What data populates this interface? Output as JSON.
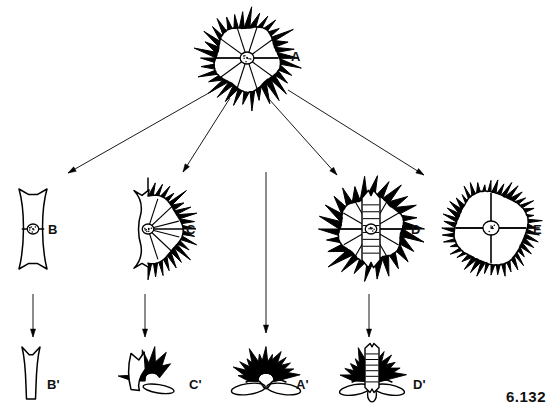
{
  "figure": {
    "plate_number": "6.132",
    "background_color": "#ffffff",
    "ink_color": "#000000",
    "width": 560,
    "height": 418
  },
  "specimens": [
    {
      "id": "A",
      "label": "A",
      "label_x": 291,
      "label_y": 50,
      "cx": 247,
      "cy": 58,
      "radius": 39,
      "type": "full-disc",
      "description": "complete radially spiny disc with central nucleus",
      "has_nucleus": true,
      "nucleus_r": 6,
      "rays": 10,
      "spines": 34,
      "spine_len": 12,
      "row": "top"
    },
    {
      "id": "B",
      "label": "B",
      "label_x": 48,
      "label_y": 223,
      "cx": 33,
      "cy": 229,
      "radius": 40,
      "half_width": 14,
      "type": "narrow-bar",
      "description": "narrow elongate bar with notched ends and central nucleus",
      "has_nucleus": true,
      "nucleus_r": 5,
      "rays": 0,
      "spines": 0,
      "spine_len": 0,
      "row": "middle"
    },
    {
      "id": "C",
      "label": "C",
      "label_x": 186,
      "label_y": 223,
      "cx": 148,
      "cy": 229,
      "radius": 40,
      "type": "half-disc",
      "description": "half disc, flat notched left margin, spiny fringe on right",
      "has_nucleus": true,
      "nucleus_r": 5,
      "rays": 6,
      "spines": 20,
      "spine_len": 11,
      "row": "middle"
    },
    {
      "id": "D",
      "label": "D",
      "label_x": 411,
      "label_y": 223,
      "cx": 371,
      "cy": 229,
      "radius": 40,
      "type": "disc-with-column",
      "description": "spiny disc with vertical banded central column",
      "has_nucleus": true,
      "nucleus_r": 5,
      "rays": 12,
      "spines": 26,
      "spine_len": 13,
      "column_bands": 9,
      "column_half_width": 9,
      "row": "middle"
    },
    {
      "id": "E",
      "label": "E",
      "label_x": 533,
      "label_y": 223,
      "cx": 491,
      "cy": 228,
      "radius": 42,
      "type": "lobed-disc",
      "description": "rounded disc with four broad smooth lobes and fine marginal fringe",
      "has_nucleus": true,
      "nucleus_r": 7,
      "rays": 4,
      "spines": 44,
      "spine_len": 7,
      "row": "middle"
    },
    {
      "id": "B'",
      "label": "B'",
      "label_x": 47,
      "label_y": 378,
      "cx": 31,
      "cy": 373,
      "radius": 26,
      "half_width": 6,
      "type": "narrow-spike",
      "description": "slender tapering spike with forked top",
      "has_nucleus": false,
      "nucleus_r": 0,
      "rays": 0,
      "spines": 0,
      "spine_len": 0,
      "row": "bottom"
    },
    {
      "id": "C'",
      "label": "C'",
      "label_x": 189,
      "label_y": 378,
      "cx": 152,
      "cy": 372,
      "radius": 30,
      "type": "partial-crown",
      "description": "one-sided fan of spines on a curved basal plate",
      "has_nucleus": false,
      "nucleus_r": 0,
      "rays": 0,
      "spines": 7,
      "spine_len": 24,
      "row": "bottom"
    },
    {
      "id": "A'",
      "label": "A'",
      "label_x": 296,
      "label_y": 378,
      "cx": 266,
      "cy": 372,
      "radius": 34,
      "type": "crown",
      "description": "symmetrical crown of spines on a flattened oval base",
      "has_nucleus": false,
      "nucleus_r": 0,
      "rays": 0,
      "spines": 13,
      "spine_len": 26,
      "row": "bottom"
    },
    {
      "id": "D'",
      "label": "D'",
      "label_x": 413,
      "label_y": 378,
      "cx": 372,
      "cy": 372,
      "radius": 34,
      "type": "crown-with-column",
      "description": "crown of spines with banded central column on lobed base",
      "has_nucleus": false,
      "nucleus_r": 0,
      "rays": 0,
      "spines": 12,
      "spine_len": 26,
      "column_bands": 7,
      "column_half_width": 7,
      "row": "bottom"
    }
  ],
  "arrows": [
    {
      "id": "A-to-B",
      "from": "A",
      "to": "B",
      "x1": 214,
      "y1": 90,
      "x2": 68,
      "y2": 173,
      "kind": "diagonal"
    },
    {
      "id": "A-to-C",
      "from": "A",
      "to": "C",
      "x1": 230,
      "y1": 98,
      "x2": 183,
      "y2": 172,
      "kind": "diagonal"
    },
    {
      "id": "A-to-A-prime",
      "from": "A",
      "to": "A'",
      "x1": 266,
      "y1": 172,
      "x2": 266,
      "y2": 333,
      "kind": "vertical"
    },
    {
      "id": "A-to-D",
      "from": "A",
      "to": "D",
      "x1": 268,
      "y1": 98,
      "x2": 337,
      "y2": 175,
      "kind": "diagonal"
    },
    {
      "id": "A-to-E",
      "from": "A",
      "to": "E",
      "x1": 288,
      "y1": 90,
      "x2": 424,
      "y2": 175,
      "kind": "diagonal"
    },
    {
      "id": "B-to-B-prime",
      "from": "B",
      "to": "B'",
      "x1": 33,
      "y1": 294,
      "x2": 33,
      "y2": 337,
      "kind": "vertical"
    },
    {
      "id": "C-to-C-prime",
      "from": "C",
      "to": "C'",
      "x1": 145,
      "y1": 294,
      "x2": 145,
      "y2": 337,
      "kind": "vertical"
    },
    {
      "id": "D-to-D-prime",
      "from": "D",
      "to": "D'",
      "x1": 369,
      "y1": 294,
      "x2": 369,
      "y2": 337,
      "kind": "vertical"
    }
  ]
}
